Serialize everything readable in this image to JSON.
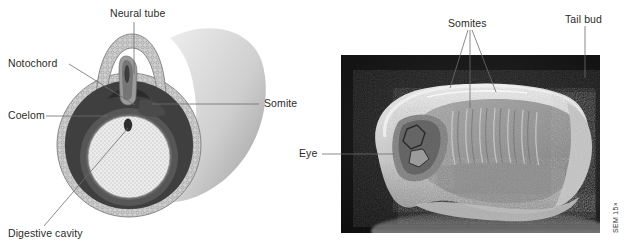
{
  "figure": {
    "background_color": "#ffffff",
    "text_color": "#2b2b2b",
    "leader_color": "#6d6d6d"
  },
  "diagram_panel": {
    "name": "embryo-cross-section-diagram",
    "labels": [
      {
        "id": "neural-tube",
        "text": "Neural tube"
      },
      {
        "id": "notochord",
        "text": "Notochord"
      },
      {
        "id": "coelom",
        "text": "Coelom"
      },
      {
        "id": "digestive-cavity",
        "text": "Digestive cavity"
      },
      {
        "id": "somite",
        "text": "Somite"
      }
    ],
    "structures": [
      {
        "id": "ectoderm-layer",
        "fill": "#b9b9b9"
      },
      {
        "id": "mesoderm-layer",
        "fill": "#4a4a4a"
      },
      {
        "id": "coelom-cavity",
        "fill": "#3a3a3a"
      },
      {
        "id": "endoderm-layer",
        "fill": "#555555"
      },
      {
        "id": "yolk-mass",
        "fill": "#ededed"
      },
      {
        "id": "notochord-body",
        "fill": "#8a8a8a"
      },
      {
        "id": "embryo-body",
        "fill": "#c9c9c9"
      }
    ]
  },
  "sem_panel": {
    "name": "sem-micrograph",
    "labels": [
      {
        "id": "somites",
        "text": "Somites"
      },
      {
        "id": "tail-bud",
        "text": "Tail bud"
      },
      {
        "id": "eye",
        "text": "Eye"
      }
    ],
    "magnification": "SEM 15×",
    "photo": {
      "background_color": "#121212",
      "specimen_color": "#9a9a9a",
      "rim_color": "#d8d8d8"
    }
  }
}
